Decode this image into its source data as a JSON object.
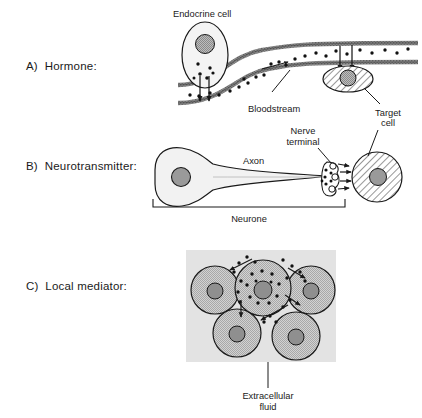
{
  "figure": {
    "width": 422,
    "height": 418,
    "background_color": "#ffffff",
    "ink_color": "#1a1a1a"
  },
  "sections": [
    {
      "id": "a",
      "label": "A)  Hormone:",
      "letter": "A)",
      "name": "Hormone:"
    },
    {
      "id": "b",
      "label": "B)  Neurotransmitter:",
      "letter": "B)",
      "name": "Neurotransmitter:"
    },
    {
      "id": "c",
      "label": "C)  Local mediator:",
      "letter": "C)",
      "name": "Local mediator:"
    }
  ],
  "panel_a": {
    "labels": {
      "endocrine_cell": "Endocrine cell",
      "bloodstream": "Bloodstream",
      "target_cell_line1": "Target",
      "target_cell_line2": "cell"
    },
    "colors": {
      "cytoplasm": "#f2f2f2",
      "nucleus": "#9a9a9a",
      "vessel_wall": "#6b6b6b",
      "vessel_lumen": "#ffffff"
    },
    "signal_molecule_count": 24,
    "secretion_arrows": 2,
    "uptake_arrows": 2,
    "flow_arrow_direction": "right"
  },
  "panel_b": {
    "labels": {
      "axon": "Axon",
      "nerve_terminal_line1": "Nerve",
      "nerve_terminal_line2": "terminal",
      "neurone": "Neurone",
      "target_cell_line1": "Target",
      "target_cell_line2": "cell"
    },
    "colors": {
      "cytoplasm": "#f2f2f2",
      "nucleus": "#9a9a9a",
      "target_fill": "#ffffff"
    },
    "synapse_arrows": 4,
    "vesicle_count": 6,
    "bracket_label": "Neurone"
  },
  "panel_c": {
    "labels": {
      "extracellular_fluid_line1": "Extracellular",
      "extracellular_fluid_line2": "fluid"
    },
    "colors": {
      "extracellular_fluid": "#e2e2e2",
      "cell_fill": "#c9c9c9",
      "nucleus": "#8f8f8f"
    },
    "cell_count": 5,
    "source_cell": "centre",
    "target_cell_count": 4,
    "diffusion_arrows": 5,
    "mediator_dot_count": 28
  }
}
